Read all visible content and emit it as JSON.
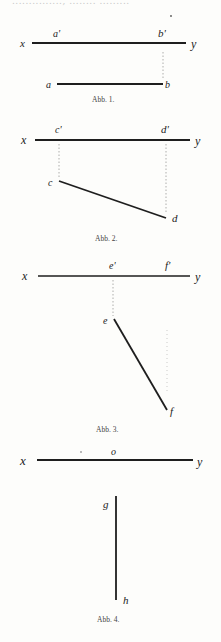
{
  "page": {
    "header_fragment": "..............., ........ .........",
    "figures": [
      {
        "caption": "Abb. 1.",
        "axis": {
          "left": "x",
          "right": "y"
        },
        "labels": {
          "a_prime": "a'",
          "b_prime": "b'",
          "a": "a",
          "b": "b"
        }
      },
      {
        "caption": "Abb. 2.",
        "axis": {
          "left": "x",
          "right": "y"
        },
        "labels": {
          "c_prime": "c'",
          "d_prime": "d'",
          "c": "c",
          "d": "d"
        }
      },
      {
        "caption": "Abb. 3.",
        "axis": {
          "left": "x",
          "right": "y"
        },
        "labels": {
          "e_prime": "e'",
          "f_prime": "f'",
          "e": "e",
          "f": "f"
        }
      },
      {
        "caption": "Abb. 4.",
        "axis": {
          "left": "x",
          "right": "y"
        },
        "labels": {
          "o": "o",
          "g": "g",
          "h": "h"
        }
      }
    ]
  },
  "colors": {
    "ink": "#1e1e1e",
    "faint": "#9a9a9a",
    "paper": "#fdfdfb"
  }
}
